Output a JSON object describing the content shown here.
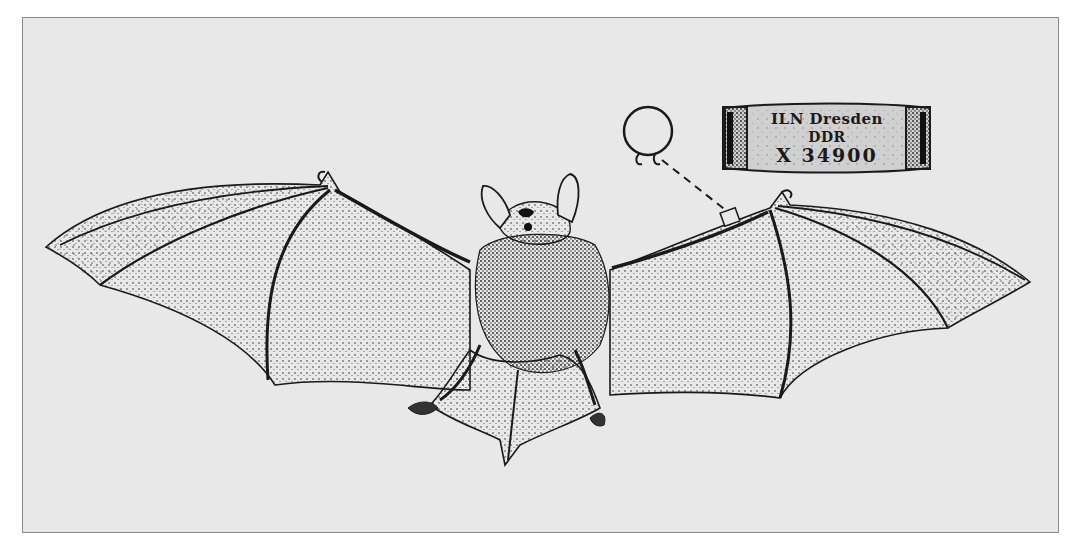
{
  "illustration": {
    "subject": "bat with spread wings, ringed on the forearm",
    "background_color": "#e8e8e8",
    "frame_color": "#8a8a8a",
    "ink_color": "#1a1a1a"
  },
  "ring_band": {
    "line1": "ILN Dresden",
    "line2": "DDR",
    "line3": "X 34900"
  },
  "ring_icon": "open-ring-icon"
}
